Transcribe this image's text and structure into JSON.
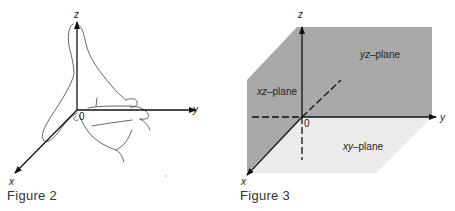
{
  "figure2": {
    "caption": "Figure 2",
    "axes": {
      "x": "x",
      "y": "y",
      "z": "z"
    },
    "origin_label": "0",
    "description": "Right hand with thumb pointing along z-axis and fingers curling from x toward y"
  },
  "figure3": {
    "caption": "Figure 3",
    "axes": {
      "x": "x",
      "y": "y",
      "z": "z"
    },
    "origin_label": "0",
    "planes": {
      "yz": {
        "italic": "yz",
        "suffix": "–plane"
      },
      "xz": {
        "italic": "xz",
        "suffix": "–plane"
      },
      "xy": {
        "italic": "xy",
        "suffix": "–plane"
      }
    },
    "colors": {
      "plane_dark": "#a9a9a9",
      "plane_light": "#ececec",
      "axis": "#111111"
    }
  }
}
